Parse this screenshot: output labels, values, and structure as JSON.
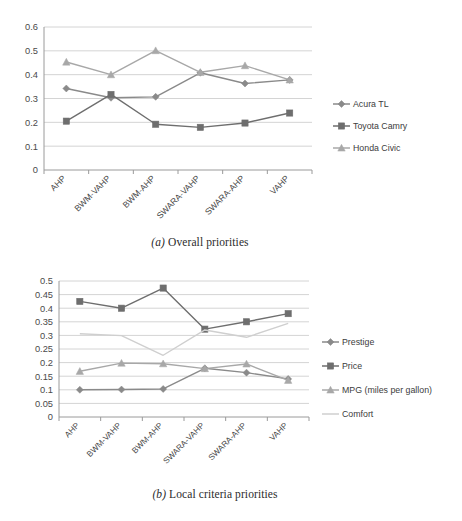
{
  "figures": [
    {
      "id": "a",
      "caption_marker": "(a)",
      "caption_text": "Overall priorities"
    },
    {
      "id": "b",
      "caption_marker": "(b)",
      "caption_text": "Local criteria priorities"
    }
  ],
  "colors": {
    "series_dark": "#6e6e6e",
    "series_mid": "#8a8a8a",
    "series_light": "#a8a8a8",
    "series_pale": "#cfcfcf",
    "grid": "#d4d4d4",
    "axis": "#9a9a9a",
    "text": "#4a4a4a"
  },
  "chart_data": [
    {
      "type": "line",
      "title": "",
      "subtitle": "",
      "xlabel": "",
      "ylabel": "",
      "ylim": [
        0,
        0.6
      ],
      "yticks": [
        "0",
        "0.1",
        "0.2",
        "0.3",
        "0.4",
        "0.5",
        "0.6"
      ],
      "ytick_values": [
        0,
        0.1,
        0.2,
        0.3,
        0.4,
        0.5,
        0.6
      ],
      "grid": true,
      "legend_position": "right",
      "categories": [
        "AHP",
        "BWM-VAHP",
        "BWM-AHP",
        "SWARA-VAHP",
        "SWARA-AHP",
        "VAHP"
      ],
      "series": [
        {
          "name": "Acura TL",
          "marker": "diamond",
          "color": "#8a8a8a",
          "values": [
            0.342,
            0.303,
            0.307,
            0.408,
            0.363,
            0.378
          ]
        },
        {
          "name": "Toyota Camry",
          "marker": "square",
          "color": "#6e6e6e",
          "values": [
            0.205,
            0.317,
            0.192,
            0.179,
            0.197,
            0.239
          ]
        },
        {
          "name": "Honda Civic",
          "marker": "triangle",
          "color": "#a8a8a8",
          "values": [
            0.453,
            0.4,
            0.501,
            0.41,
            0.438,
            0.378
          ]
        }
      ]
    },
    {
      "type": "line",
      "title": "",
      "subtitle": "",
      "xlabel": "",
      "ylabel": "",
      "ylim": [
        0,
        0.5
      ],
      "yticks": [
        "0",
        "0.05",
        "0.1",
        "0.15",
        "0.2",
        "0.25",
        "0.3",
        "0.35",
        "0.4",
        "0.45",
        "0.5"
      ],
      "ytick_values": [
        0,
        0.05,
        0.1,
        0.15,
        0.2,
        0.25,
        0.3,
        0.35,
        0.4,
        0.45,
        0.5
      ],
      "grid": true,
      "legend_position": "right",
      "categories": [
        "AHP",
        "BWM-VAHP",
        "BWM-AHP",
        "SWARA-VAHP",
        "SWARA-AHP",
        "VAHP"
      ],
      "series": [
        {
          "name": "Prestige",
          "marker": "diamond",
          "color": "#8a8a8a",
          "values": [
            0.1,
            0.101,
            0.103,
            0.179,
            0.163,
            0.14
          ]
        },
        {
          "name": "Price",
          "marker": "square",
          "color": "#6e6e6e",
          "values": [
            0.425,
            0.4,
            0.474,
            0.323,
            0.35,
            0.38
          ]
        },
        {
          "name": "MPG (miles per gallon)",
          "marker": "triangle",
          "color": "#a8a8a8",
          "values": [
            0.168,
            0.198,
            0.196,
            0.178,
            0.195,
            0.135
          ]
        },
        {
          "name": "Comfort",
          "marker": "none",
          "color": "#cfcfcf",
          "values": [
            0.306,
            0.299,
            0.227,
            0.32,
            0.293,
            0.344
          ]
        }
      ]
    }
  ]
}
